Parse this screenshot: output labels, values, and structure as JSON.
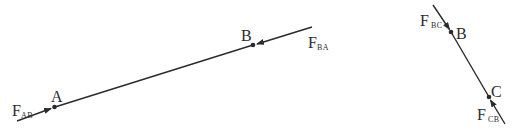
{
  "diagram": {
    "left_member": {
      "points": [
        {
          "name": "A",
          "label": "A"
        },
        {
          "name": "B",
          "label": "B"
        }
      ],
      "forces": [
        {
          "symbol": "F",
          "subscript": "AB",
          "acts_at": "A",
          "direction": "toward A along member"
        },
        {
          "symbol": "F",
          "subscript": "BA",
          "acts_at": "B",
          "direction": "toward B along member"
        }
      ]
    },
    "right_member": {
      "points": [
        {
          "name": "B",
          "label": "B"
        },
        {
          "name": "C",
          "label": "C"
        }
      ],
      "forces": [
        {
          "symbol": "F",
          "subscript": "BC",
          "acts_at": "B",
          "direction": "toward B along member"
        },
        {
          "symbol": "F",
          "subscript": "CB",
          "acts_at": "C",
          "direction": "toward C along member"
        }
      ]
    },
    "colors": {
      "line": "#2b2b2b",
      "background": "#ffffff"
    }
  }
}
